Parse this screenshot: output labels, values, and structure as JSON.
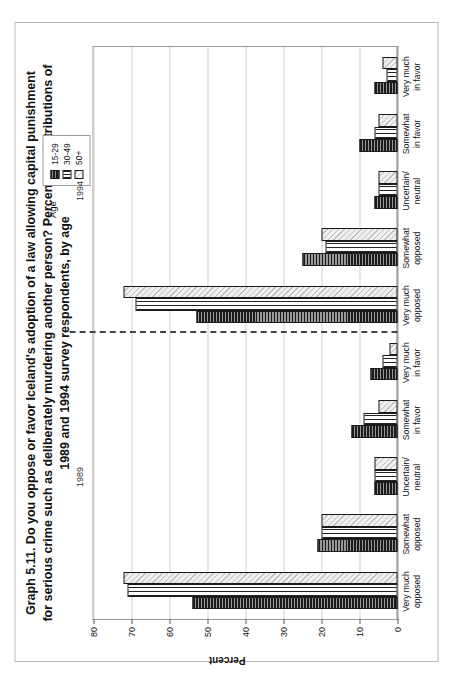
{
  "figure": {
    "title_lines": [
      "Graph 5.11.  Do you oppose or favor Iceland's adoption of a law allowing capital punishment",
      "for serious crime such as deliberately murdering another person? Percentage distributions of",
      "1989 and 1994 survey respondents, by age"
    ],
    "title_full": "Graph 5.11. Do you oppose or favor Iceland's adoption of a law allowing capital punishment for serious crime such as deliberately murdering another person? Percentage distributions of 1989 and 1994 survey respondents, by age"
  },
  "legend": {
    "title": "Age",
    "entries": [
      {
        "label": "15-29",
        "swatch": "black-horizontal-hatch"
      },
      {
        "label": "30-49",
        "swatch": "vertical-line-hatch"
      },
      {
        "label": "50+",
        "swatch": "light-diagonal-hatch"
      }
    ]
  },
  "panels": [
    {
      "year_label": "1989"
    },
    {
      "year_label": "1994"
    }
  ],
  "axis": {
    "ylabel": "Percent",
    "yticks": [
      0,
      10,
      20,
      30,
      40,
      50,
      60,
      70,
      80
    ],
    "ylim": [
      0,
      80
    ]
  },
  "chart_data": {
    "type": "bar",
    "xlabel": "",
    "ylabel": "Percent",
    "ylim": [
      0,
      80
    ],
    "yticks": [
      0,
      10,
      20,
      30,
      40,
      50,
      60,
      70,
      80
    ],
    "grid": true,
    "legend_title": "Age",
    "legend_position": "top-right",
    "panel_divider": "dashed vertical line between 1989 and 1994 groups",
    "panels": [
      "1989",
      "1994"
    ],
    "categories": [
      "Very much opposed",
      "Somewhat opposed",
      "Uncertain/ neutral",
      "Somewhat in favor",
      "Very much in favor",
      "Very much opposed",
      "Somewhat opposed",
      "Uncertain/ neutral",
      "Somewhat in favor",
      "Very much in favor"
    ],
    "category_panel": [
      "1989",
      "1989",
      "1989",
      "1989",
      "1989",
      "1994",
      "1994",
      "1994",
      "1994",
      "1994"
    ],
    "series": [
      {
        "name": "15-29",
        "values": [
          54,
          21,
          6,
          12,
          7,
          53,
          25,
          6,
          10,
          6
        ]
      },
      {
        "name": "30-49",
        "values": [
          71,
          20,
          6,
          9,
          4,
          69,
          19,
          5,
          6,
          3
        ]
      },
      {
        "name": "50+",
        "values": [
          72,
          20,
          6,
          5,
          2,
          72,
          20,
          5,
          5,
          4
        ]
      }
    ]
  }
}
